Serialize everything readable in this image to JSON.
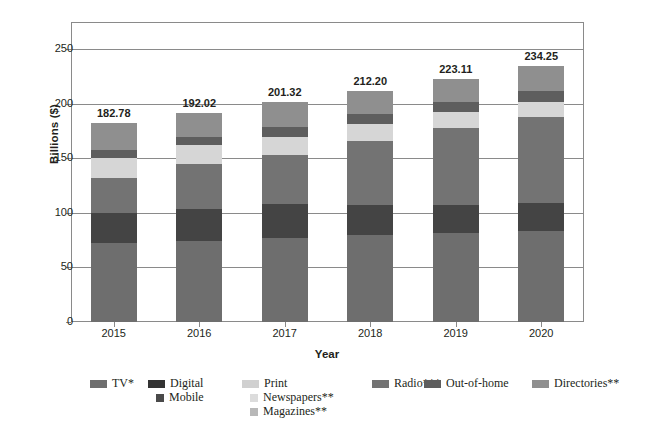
{
  "chart_data": {
    "type": "bar",
    "subtype": "stacked-column",
    "title": "",
    "xlabel": "Year",
    "ylabel": "Billions ($)",
    "categories": [
      "2015",
      "2016",
      "2017",
      "2018",
      "2019",
      "2020"
    ],
    "ylim": [
      0,
      275
    ],
    "yticks": [
      0,
      50,
      100,
      150,
      200,
      250
    ],
    "ytick_labels": [
      "0",
      "50",
      "100",
      "150",
      "200",
      "250"
    ],
    "grid": true,
    "legend_position": "bottom",
    "totals": [
      182.78,
      192.02,
      201.32,
      212.2,
      223.11,
      234.25
    ],
    "total_labels": [
      "182.78",
      "192.02",
      "201.32",
      "212.20",
      "223.11",
      "234.25"
    ],
    "series": [
      {
        "name": "TV*",
        "color": "#6e6e6e",
        "values": [
          72.0,
          74.5,
          77.0,
          79.5,
          81.5,
          83.5
        ]
      },
      {
        "name": "Digital",
        "color": "#444444",
        "values": [
          28.0,
          29.5,
          31.0,
          27.5,
          26.0,
          25.5
        ]
      },
      {
        "name": "Radio***",
        "color": "#737373",
        "values": [
          32.0,
          40.5,
          45.5,
          59.0,
          70.0,
          78.5
        ]
      },
      {
        "name": "Print",
        "color": "#d6d6d6",
        "values": [
          18.5,
          17.5,
          16.5,
          15.5,
          15.0,
          14.5
        ]
      },
      {
        "name": "Out-of-home",
        "color": "#5e5e5e",
        "values": [
          7.5,
          8.0,
          8.5,
          9.0,
          9.5,
          10.0
        ]
      },
      {
        "name": "Directories**",
        "color": "#8f8f8f",
        "values": [
          24.78,
          22.02,
          22.82,
          21.7,
          21.11,
          22.25
        ]
      }
    ],
    "legend_entries": [
      {
        "label": "TV*",
        "color": "#6e6e6e",
        "swatch": "wide",
        "row": 0,
        "col": 0
      },
      {
        "label": "Digital",
        "color": "#333333",
        "swatch": "wide",
        "row": 0,
        "col": 1
      },
      {
        "label": "Mobile",
        "color": "#4a4a4a",
        "swatch": "small",
        "row": 1,
        "col": 1
      },
      {
        "label": "Print",
        "color": "#d0d0d0",
        "swatch": "wide",
        "row": 0,
        "col": 2
      },
      {
        "label": "Newspapers**",
        "color": "#dcdcdc",
        "swatch": "small",
        "row": 1,
        "col": 2
      },
      {
        "label": "Magazines**",
        "color": "#b8b8b8",
        "swatch": "small",
        "row": 2,
        "col": 2
      },
      {
        "label": "Radio***",
        "color": "#737373",
        "swatch": "wide",
        "row": 0,
        "col": 3
      },
      {
        "label": "Out-of-home",
        "color": "#5e5e5e",
        "swatch": "wide",
        "row": 0,
        "col": 4
      },
      {
        "label": "Directories**",
        "color": "#8f8f8f",
        "swatch": "wide",
        "row": 0,
        "col": 5
      }
    ]
  },
  "axes": {
    "y_title": "Billions ($)",
    "x_title": "Year"
  }
}
